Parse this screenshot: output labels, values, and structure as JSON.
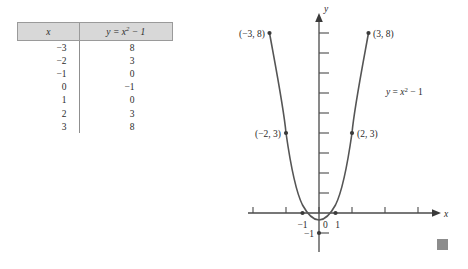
{
  "figure": {
    "kind": "math-textbook-figure",
    "end_marker": {
      "name": "end-of-example-square",
      "color": "#8c8c8c"
    }
  },
  "table": {
    "headers": {
      "x": "x",
      "y": "y = x² − 1"
    },
    "header_x_label": "x",
    "header_y_prefix": "y",
    "header_y_eq": " = ",
    "header_y_var": "x",
    "header_y_exp": "2",
    "header_y_tail": " − 1",
    "rows": [
      {
        "x": "−3",
        "y": "8"
      },
      {
        "x": "−2",
        "y": "3"
      },
      {
        "x": "−1",
        "y": "0"
      },
      {
        "x": "0",
        "y": "−1"
      },
      {
        "x": "1",
        "y": "0"
      },
      {
        "x": "2",
        "y": "3"
      },
      {
        "x": "3",
        "y": "8"
      }
    ]
  },
  "graph": {
    "axis_labels": {
      "x": "x",
      "y": "y"
    },
    "origin_label": "0",
    "x_tick_labels": [
      {
        "value": -1,
        "text": "−1"
      },
      {
        "value": 1,
        "text": "1"
      }
    ],
    "y_tick_labels": [
      {
        "value": -1,
        "text": "−1"
      }
    ],
    "curve_label": {
      "prefix": "y",
      "eq": " = ",
      "var": "x",
      "exp": "2",
      "tail": " − 1",
      "full": "y = x² − 1"
    },
    "point_labels": [
      {
        "text": "(−3, 8)",
        "x": -3,
        "y": 8
      },
      {
        "text": "(3, 8)",
        "x": 3,
        "y": 8
      },
      {
        "text": "(−2, 3)",
        "x": -2,
        "y": 3
      },
      {
        "text": "(2, 3)",
        "x": 2,
        "y": 3
      }
    ]
  },
  "chart_data": {
    "type": "line",
    "title": "",
    "xlabel": "x",
    "ylabel": "y",
    "equation": "y = x^2 - 1",
    "xlim": [
      -3.6,
      3.6
    ],
    "ylim": [
      -1.6,
      9.6
    ],
    "grid": false,
    "legend": null,
    "x_ticks": [
      -3,
      -2,
      -1,
      1,
      2,
      3
    ],
    "y_ticks": [
      -1,
      1,
      2,
      3,
      4,
      5,
      6,
      7,
      8,
      9
    ],
    "x_tick_labels_shown": [
      "−1",
      "1"
    ],
    "y_tick_labels_shown": [
      "−1"
    ],
    "series": [
      {
        "name": "y = x^2 - 1",
        "x": [
          -3,
          -2.5,
          -2,
          -1.5,
          -1,
          -0.5,
          0,
          0.5,
          1,
          1.5,
          2,
          2.5,
          3
        ],
        "values": [
          8,
          5.25,
          3,
          1.25,
          0,
          -0.75,
          -1,
          -0.75,
          0,
          1.25,
          3,
          5.25,
          8
        ]
      }
    ],
    "marked_points": [
      {
        "x": -3,
        "y": 8,
        "label": "(−3, 8)"
      },
      {
        "x": -2,
        "y": 3,
        "label": "(−2, 3)"
      },
      {
        "x": -1,
        "y": 0,
        "label": ""
      },
      {
        "x": 0,
        "y": -1,
        "label": ""
      },
      {
        "x": 1,
        "y": 0,
        "label": ""
      },
      {
        "x": 2,
        "y": 3,
        "label": "(2, 3)"
      },
      {
        "x": 3,
        "y": 8,
        "label": "(3, 8)"
      }
    ],
    "table_representation": {
      "columns": [
        "x",
        "y = x^2 - 1"
      ],
      "x": [
        -3,
        -2,
        -1,
        0,
        1,
        2,
        3
      ],
      "y": [
        8,
        3,
        0,
        -1,
        0,
        3,
        8
      ]
    }
  }
}
